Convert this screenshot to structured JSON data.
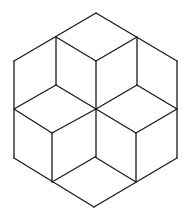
{
  "diagram": {
    "stroke_color": "#1a1a1a",
    "background": "#ffffff",
    "vertices": {
      "top": [
        96,
        13
      ],
      "upper_left_join": [
        56,
        37
      ],
      "upper_right_join": [
        137,
        37
      ],
      "left_top": [
        14,
        61
      ],
      "center_top": [
        96,
        61
      ],
      "right_top": [
        177,
        61
      ],
      "mid_left_join": [
        56,
        85
      ],
      "mid_right_join": [
        137,
        85
      ],
      "left_mid": [
        14,
        109
      ],
      "center": [
        96,
        109
      ],
      "right_mid": [
        177,
        109
      ],
      "lower_left_join": [
        52,
        133
      ],
      "lower_right_join": [
        136,
        133
      ],
      "left_bottom": [
        14,
        158
      ],
      "center_bottom": [
        95,
        157
      ],
      "right_bottom": [
        177,
        158
      ],
      "bottom_left_join": [
        52,
        182
      ],
      "bottom_right_join": [
        136,
        182
      ],
      "bottom": [
        94,
        207
      ]
    }
  }
}
